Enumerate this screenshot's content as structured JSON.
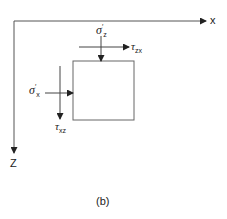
{
  "axes": {
    "x_label": "x",
    "z_label": "Z"
  },
  "stresses": {
    "sigma_z": {
      "symbol": "σ",
      "prime": "′",
      "sub": "z"
    },
    "tau_zx": {
      "symbol": "τ",
      "sub": "zx"
    },
    "sigma_x": {
      "symbol": "σ",
      "prime": "′",
      "sub": "x"
    },
    "tau_xz": {
      "symbol": "τ",
      "sub": "xz"
    }
  },
  "caption": "(b)",
  "colors": {
    "line": "#555555",
    "text": "#222222"
  }
}
